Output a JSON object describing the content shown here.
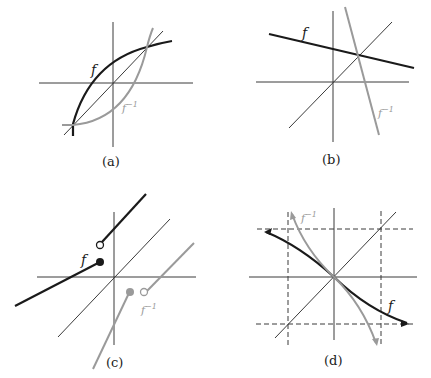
{
  "figure": {
    "panels": [
      {
        "id": "a",
        "caption": "(a)",
        "f_label": "f",
        "finv_label": "f",
        "finv_sup": "−1",
        "description": "increasing concave f and its inverse reflected across y=x, intersecting at two points on y=x"
      },
      {
        "id": "b",
        "caption": "(b)",
        "f_label": "f",
        "finv_label": "f",
        "finv_sup": "−1",
        "description": "decreasing line f and steep decreasing inverse line, crossing on y=x"
      },
      {
        "id": "c",
        "caption": "(c)",
        "f_label": "f",
        "finv_label": "f",
        "finv_sup": "−1",
        "description": "piecewise increasing f with jump (closed dot below, open dot above) and its reflected inverse"
      },
      {
        "id": "d",
        "caption": "(d)",
        "f_label": "f",
        "finv_label": "f",
        "finv_sup": "−1",
        "description": "decreasing f with horizontal asymptotes (dashed) and inverse with vertical asymptotes (dashed)"
      }
    ],
    "colors": {
      "f": "#1a1a1a",
      "finv": "#9a9a9a",
      "axis": "#3a3a3a"
    }
  }
}
